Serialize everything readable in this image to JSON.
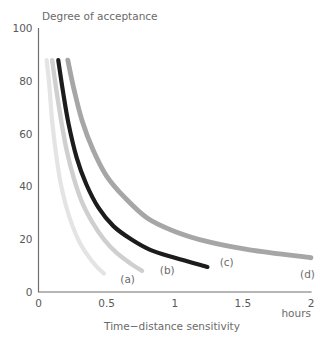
{
  "chart_data": {
    "type": "line",
    "title": "",
    "xlabel": "Time−distance sensitivity",
    "ylabel": "Degree of acceptance",
    "x_unit": "hours",
    "xlim": [
      0,
      2
    ],
    "ylim": [
      0,
      100
    ],
    "xticks": [
      "0",
      "0.5",
      "1",
      "1.5",
      "2"
    ],
    "xtick_values": [
      0,
      0.5,
      1,
      1.5,
      2
    ],
    "yticks": [
      "0",
      "20",
      "40",
      "60",
      "80",
      "100"
    ],
    "ytick_values": [
      0,
      20,
      40,
      60,
      80,
      100
    ],
    "grid": false,
    "legend_position": "inline-end-labels",
    "series": [
      {
        "name": "(a)",
        "label": "(a)",
        "color": "#e4e4e4",
        "stroke_width": 4.2,
        "x": [
          0.06,
          0.08,
          0.1,
          0.13,
          0.16,
          0.2,
          0.25,
          0.3,
          0.36,
          0.42,
          0.48
        ],
        "y": [
          88,
          78,
          65,
          52,
          42,
          33,
          25,
          19,
          14,
          10,
          7
        ],
        "label_x": 0.6,
        "label_y": 3.5
      },
      {
        "name": "(b)",
        "label": "(b)",
        "color": "#cfcfcf",
        "stroke_width": 4.4,
        "x": [
          0.1,
          0.13,
          0.17,
          0.21,
          0.26,
          0.32,
          0.4,
          0.48,
          0.57,
          0.67,
          0.76
        ],
        "y": [
          88,
          77,
          64,
          53,
          43,
          34,
          26,
          20,
          15,
          11,
          8
        ],
        "label_x": 0.89,
        "label_y": 7.0
      },
      {
        "name": "(c)",
        "label": "(c)",
        "color": "#1c1c1c",
        "stroke_width": 4.2,
        "x": [
          0.145,
          0.18,
          0.22,
          0.28,
          0.35,
          0.44,
          0.55,
          0.68,
          0.82,
          1.0,
          1.24
        ],
        "y": [
          88,
          76,
          64,
          51,
          41,
          32,
          25,
          20,
          16,
          13,
          9.5
        ],
        "label_x": 1.33,
        "label_y": 10.0
      },
      {
        "name": "(d)",
        "label": "(d)",
        "color": "#a6a6a6",
        "stroke_width": 4.8,
        "x": [
          0.215,
          0.26,
          0.32,
          0.4,
          0.5,
          0.63,
          0.8,
          1.0,
          1.25,
          1.55,
          2.0
        ],
        "y": [
          88,
          77,
          65,
          54,
          44,
          36,
          28,
          23,
          19,
          16,
          13
        ],
        "label_x": 1.92,
        "label_y": 5.5
      }
    ]
  }
}
